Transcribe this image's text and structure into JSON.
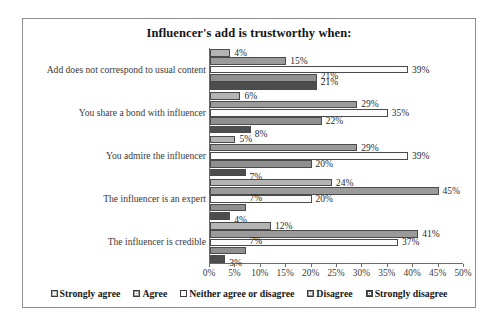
{
  "chart_data": {
    "type": "bar",
    "orientation": "horizontal",
    "title": "Influencer's add is trustworthy when:",
    "xlabel": "",
    "ylabel": "",
    "xlim": [
      0,
      50
    ],
    "grid": false,
    "legend_position": "bottom",
    "tick_labels": [
      "0%",
      "5%",
      "10%",
      "15%",
      "20%",
      "25%",
      "30%",
      "35%",
      "40%",
      "45%",
      "50%"
    ],
    "tick_values": [
      0,
      5,
      10,
      15,
      20,
      25,
      30,
      35,
      40,
      45,
      50
    ],
    "categories": [
      "Add does not correspond to usual content",
      "You share a bond with influencer",
      "You admire the influencer",
      "The influencer is an expert",
      "The influencer is credible"
    ],
    "series": [
      {
        "name": "Strongly agree",
        "color": "#b4b4b4",
        "values": [
          4,
          6,
          5,
          24,
          12
        ],
        "labels": [
          "4%",
          "6%",
          "5%",
          "24%",
          "12%"
        ]
      },
      {
        "name": "Agree",
        "color": "#9a9a9a",
        "values": [
          15,
          29,
          29,
          45,
          41
        ],
        "labels": [
          "15%",
          "29%",
          "29%",
          "45%",
          "41%"
        ]
      },
      {
        "name": "Neither agree or disagree",
        "color": "#fbfbfb",
        "values": [
          39,
          35,
          39,
          20,
          37
        ],
        "labels": [
          "39%",
          "35%",
          "39%",
          "20%",
          "37%"
        ]
      },
      {
        "name": "Disagree",
        "color": "#8f8f8f",
        "values": [
          21,
          22,
          20,
          7,
          7
        ],
        "labels": [
          "21%",
          "22%",
          "20%",
          "7%",
          "7%"
        ]
      },
      {
        "name": "Strongly disagree",
        "color": "#4d4d4d",
        "values": [
          21,
          8,
          7,
          4,
          3
        ],
        "labels": [
          "21%",
          "8%",
          "7%",
          "4%",
          "3%"
        ]
      }
    ]
  }
}
